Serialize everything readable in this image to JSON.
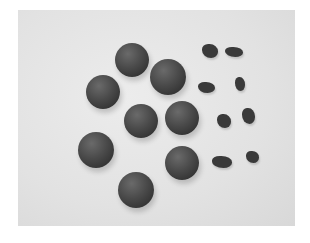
{
  "image": {
    "description": "Photo of nine dark round balls and eight small irregular dark pieces on a light gray background",
    "background_color": "#e4e4e4",
    "object_color": "#444444",
    "balls": [
      {
        "cx": 132,
        "cy": 60,
        "r": 17
      },
      {
        "cx": 168,
        "cy": 77,
        "r": 18
      },
      {
        "cx": 103,
        "cy": 92,
        "r": 17
      },
      {
        "cx": 141,
        "cy": 121,
        "r": 17
      },
      {
        "cx": 182,
        "cy": 118,
        "r": 17
      },
      {
        "cx": 96,
        "cy": 150,
        "r": 18
      },
      {
        "cx": 182,
        "cy": 163,
        "r": 17
      },
      {
        "cx": 136,
        "cy": 190,
        "r": 18
      }
    ],
    "pieces": [
      {
        "x": 202,
        "y": 44,
        "w": 16,
        "h": 14
      },
      {
        "x": 225,
        "y": 47,
        "w": 18,
        "h": 10
      },
      {
        "x": 198,
        "y": 82,
        "w": 17,
        "h": 11
      },
      {
        "x": 235,
        "y": 77,
        "w": 10,
        "h": 14
      },
      {
        "x": 217,
        "y": 114,
        "w": 14,
        "h": 14
      },
      {
        "x": 242,
        "y": 108,
        "w": 13,
        "h": 16
      },
      {
        "x": 212,
        "y": 156,
        "w": 20,
        "h": 12
      },
      {
        "x": 246,
        "y": 151,
        "w": 13,
        "h": 12
      }
    ]
  }
}
